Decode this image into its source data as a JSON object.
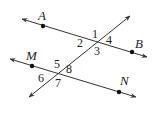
{
  "diagram": {
    "type": "geometry-lines",
    "stroke_color": "#333333",
    "lines": [
      {
        "name": "AB",
        "from": [
          22,
          19
        ],
        "to": [
          147,
          57
        ]
      },
      {
        "name": "MN",
        "from": [
          10,
          59
        ],
        "to": [
          136,
          97
        ]
      },
      {
        "name": "transversal",
        "from": [
          29,
          97
        ],
        "to": [
          130,
          16
        ]
      }
    ],
    "points": [
      {
        "label": "A",
        "x": 43,
        "y": 26,
        "lx": 38,
        "ly": 20
      },
      {
        "label": "B",
        "x": 132,
        "y": 52,
        "lx": 135,
        "ly": 48
      },
      {
        "label": "M",
        "x": 32,
        "y": 66,
        "lx": 26,
        "ly": 60
      },
      {
        "label": "N",
        "x": 119,
        "y": 92,
        "lx": 120,
        "ly": 85
      }
    ],
    "angles": [
      {
        "label": "1",
        "x": 92,
        "y": 38
      },
      {
        "label": "2",
        "x": 77,
        "y": 47
      },
      {
        "label": "3",
        "x": 94,
        "y": 55
      },
      {
        "label": "4",
        "x": 106,
        "y": 44
      },
      {
        "label": "5",
        "x": 54,
        "y": 68
      },
      {
        "label": "6",
        "x": 38,
        "y": 82
      },
      {
        "label": "7",
        "x": 55,
        "y": 87
      },
      {
        "label": "8",
        "x": 66,
        "y": 73
      }
    ]
  }
}
